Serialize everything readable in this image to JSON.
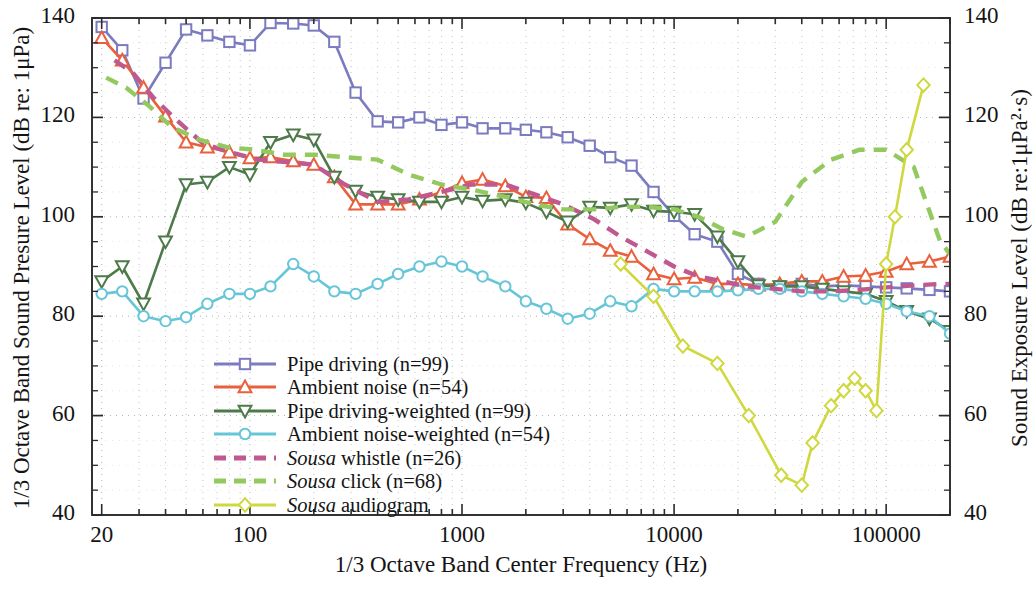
{
  "chart_data": {
    "type": "line",
    "title": "",
    "xlabel": "1/3 Octave Band Center Frequency (Hz)",
    "ylabel": "1/3 Octave Band Sound Presure Level (dB re: 1μPa)",
    "ylabel_right": "Sound Exposure Level (dB re:1μPa²·s)",
    "xscale": "log",
    "xlim": [
      18,
      200000
    ],
    "ylim": [
      40,
      140
    ],
    "xticks": [
      20,
      100,
      1000,
      10000,
      100000
    ],
    "xticklabels": [
      "20",
      "100",
      "1000",
      "10000",
      "100000"
    ],
    "yticks": [
      40,
      60,
      80,
      100,
      120,
      140
    ],
    "yticklabels": [
      "40",
      "60",
      "80",
      "100",
      "120",
      "140"
    ],
    "yticklabels_right": [
      "40",
      "60",
      "80",
      "100",
      "120",
      "140"
    ],
    "grid": true,
    "grid_style": "dotted",
    "legend_position": "center-left-lower",
    "series": [
      {
        "name": "Pipe driving (n=99)",
        "color": "#7b7bc0",
        "marker": "square",
        "linestyle": "solid",
        "x": [
          20,
          25,
          31.5,
          40,
          50,
          63,
          80,
          100,
          125,
          160,
          200,
          250,
          315,
          400,
          500,
          630,
          800,
          1000,
          1250,
          1600,
          2000,
          2500,
          3150,
          4000,
          5000,
          6300,
          8000,
          10000,
          12500,
          16000,
          20000,
          25000,
          31500,
          40000,
          50000,
          63000,
          80000,
          100000,
          125000,
          160000,
          200000
        ],
        "y": [
          138.2,
          133.5,
          123.8,
          131.0,
          137.7,
          136.5,
          135.2,
          134.5,
          139.0,
          138.9,
          138.5,
          135.2,
          125.0,
          119.2,
          119.0,
          120.0,
          118.5,
          119.0,
          117.8,
          117.8,
          117.5,
          117.0,
          116.0,
          114.3,
          112.0,
          110.3,
          105.0,
          100.2,
          96.5,
          95.0,
          88.5,
          86.5,
          86.0,
          86.5,
          86.0,
          86.2,
          86.0,
          85.8,
          85.6,
          85.3,
          85.0
        ]
      },
      {
        "name": "Ambient noise (n=54)",
        "color": "#e8603c",
        "marker": "triangle-up",
        "linestyle": "solid",
        "x": [
          20,
          25,
          31.5,
          40,
          50,
          63,
          80,
          100,
          125,
          160,
          200,
          250,
          315,
          400,
          500,
          630,
          800,
          1000,
          1250,
          1600,
          2000,
          2500,
          3150,
          4000,
          5000,
          6300,
          8000,
          10000,
          12500,
          16000,
          20000,
          25000,
          31500,
          40000,
          50000,
          63000,
          80000,
          100000,
          125000,
          160000,
          200000
        ],
        "y": [
          136.0,
          131.5,
          126.0,
          120.2,
          115.0,
          114.0,
          113.0,
          111.8,
          112.0,
          111.2,
          110.5,
          108.0,
          102.5,
          102.5,
          102.5,
          103.5,
          105.0,
          106.8,
          107.5,
          106.2,
          104.0,
          103.8,
          98.5,
          95.5,
          93.2,
          92.0,
          88.5,
          87.5,
          87.8,
          86.5,
          86.5,
          86.2,
          86.5,
          87.0,
          87.0,
          88.0,
          88.2,
          89.0,
          90.5,
          91.0,
          92.0
        ]
      },
      {
        "name": "Pipe driving-weighted (n=99)",
        "color": "#4e7a4a",
        "marker": "triangle-down",
        "linestyle": "solid",
        "x": [
          20,
          25,
          31.5,
          40,
          50,
          63,
          80,
          100,
          125,
          160,
          200,
          250,
          315,
          400,
          500,
          630,
          800,
          1000,
          1250,
          1600,
          2000,
          2500,
          3150,
          4000,
          5000,
          6300,
          8000,
          10000,
          12500,
          16000,
          20000,
          25000,
          31500,
          40000,
          50000,
          63000,
          80000,
          100000,
          125000,
          160000,
          200000
        ],
        "y": [
          87.0,
          90.0,
          82.5,
          95.0,
          106.5,
          107.0,
          110.0,
          108.5,
          115.0,
          116.5,
          115.5,
          108.0,
          105.2,
          104.0,
          103.5,
          103.0,
          103.0,
          104.0,
          103.2,
          103.5,
          102.8,
          101.0,
          99.0,
          102.0,
          101.8,
          102.5,
          101.2,
          101.0,
          100.5,
          96.0,
          91.0,
          86.2,
          86.0,
          86.0,
          85.5,
          85.0,
          84.5,
          83.0,
          81.0,
          79.5,
          77.0
        ]
      },
      {
        "name": "Ambient noise-weighted (n=54)",
        "color": "#66c6d8",
        "marker": "circle",
        "linestyle": "solid",
        "x": [
          20,
          25,
          31.5,
          40,
          50,
          63,
          80,
          100,
          125,
          160,
          200,
          250,
          315,
          400,
          500,
          630,
          800,
          1000,
          1250,
          1600,
          2000,
          2500,
          3150,
          4000,
          5000,
          6300,
          8000,
          10000,
          12500,
          16000,
          20000,
          25000,
          31500,
          40000,
          50000,
          63000,
          80000,
          100000,
          125000,
          160000,
          200000
        ],
        "y": [
          84.5,
          85.0,
          80.0,
          79.0,
          79.8,
          82.5,
          84.5,
          84.5,
          86.0,
          90.5,
          88.0,
          85.0,
          84.5,
          86.5,
          88.5,
          90.0,
          91.0,
          90.0,
          88.0,
          86.0,
          83.0,
          81.5,
          79.5,
          80.5,
          83.0,
          82.0,
          85.5,
          85.0,
          85.0,
          85.0,
          85.2,
          85.5,
          85.5,
          85.0,
          84.5,
          84.0,
          83.5,
          82.5,
          81.0,
          80.0,
          76.5
        ]
      },
      {
        "name": "Sousa whistle (n=26)",
        "name_italic_prefix": "Sousa",
        "name_rest": " whistle (n=26)",
        "color": "#c0598f",
        "marker": "none",
        "linestyle": "dashed",
        "x": [
          23,
          28,
          35,
          45,
          60,
          80,
          110,
          150,
          200,
          280,
          400,
          560,
          800,
          1100,
          1600,
          2200,
          3000,
          4200,
          5600,
          7500,
          10000,
          13000,
          17000,
          22000,
          30000,
          40000,
          55000,
          75000,
          100000,
          135000,
          180000,
          200000
        ],
        "y": [
          131.5,
          129.0,
          124.0,
          119.5,
          114.8,
          113.0,
          111.5,
          111.0,
          110.5,
          106.5,
          103.0,
          103.5,
          105.0,
          106.5,
          106.5,
          104.5,
          102.5,
          99.5,
          96.0,
          93.0,
          90.0,
          88.0,
          87.0,
          86.0,
          85.5,
          85.0,
          85.0,
          85.3,
          85.8,
          86.2,
          86.5,
          86.5
        ]
      },
      {
        "name": "Sousa click (n=68)",
        "name_italic_prefix": "Sousa",
        "name_rest": " click (n=68)",
        "color": "#94c95f",
        "marker": "none",
        "linestyle": "dashed",
        "x": [
          21,
          26,
          33,
          43,
          58,
          78,
          105,
          145,
          200,
          280,
          400,
          560,
          800,
          1100,
          1600,
          2200,
          3000,
          4200,
          5600,
          7500,
          10000,
          13000,
          17000,
          22000,
          30000,
          40000,
          55000,
          75000,
          100000,
          135000,
          180000,
          200000
        ],
        "y": [
          128.0,
          126.0,
          122.5,
          118.0,
          115.5,
          114.0,
          113.5,
          112.5,
          112.5,
          112.0,
          111.5,
          108.5,
          106.5,
          105.5,
          104.0,
          102.5,
          101.5,
          101.5,
          102.0,
          102.0,
          101.5,
          100.0,
          97.5,
          96.0,
          99.0,
          107.0,
          111.5,
          113.5,
          113.5,
          110.0,
          95.0,
          92.5
        ]
      },
      {
        "name": "Sousa audiogram",
        "name_italic_prefix": "Sousa",
        "name_rest": " audiogram",
        "color": "#cfd83f",
        "marker": "diamond",
        "linestyle": "solid",
        "x": [
          5600,
          8000,
          11000,
          16000,
          22500,
          32000,
          40000,
          45000,
          55000,
          63000,
          71000,
          80000,
          90000,
          100000,
          110000,
          125000,
          150000
        ],
        "y": [
          90.5,
          84.0,
          74.0,
          70.5,
          60.0,
          48.0,
          46.0,
          54.5,
          62.0,
          65.0,
          67.5,
          65.0,
          61.0,
          90.5,
          100.0,
          113.5,
          126.5
        ]
      }
    ],
    "legend": [
      {
        "label": "Pipe driving (n=99)",
        "color": "#7b7bc0",
        "marker": "square",
        "linestyle": "solid"
      },
      {
        "label": "Ambient noise (n=54)",
        "color": "#e8603c",
        "marker": "triangle-up",
        "linestyle": "solid"
      },
      {
        "label": "Pipe driving-weighted (n=99)",
        "color": "#4e7a4a",
        "marker": "triangle-down",
        "linestyle": "solid"
      },
      {
        "label": "Ambient noise-weighted (n=54)",
        "color": "#66c6d8",
        "marker": "circle",
        "linestyle": "solid"
      },
      {
        "label_italic": "Sousa",
        "label_rest": " whistle (n=26)",
        "color": "#c0598f",
        "marker": "none",
        "linestyle": "dashed"
      },
      {
        "label_italic": "Sousa",
        "label_rest": " click (n=68)",
        "color": "#94c95f",
        "marker": "none",
        "linestyle": "dashed"
      },
      {
        "label_italic": "Sousa",
        "label_rest": " audiogram",
        "color": "#cfd83f",
        "marker": "diamond",
        "linestyle": "solid"
      }
    ]
  }
}
